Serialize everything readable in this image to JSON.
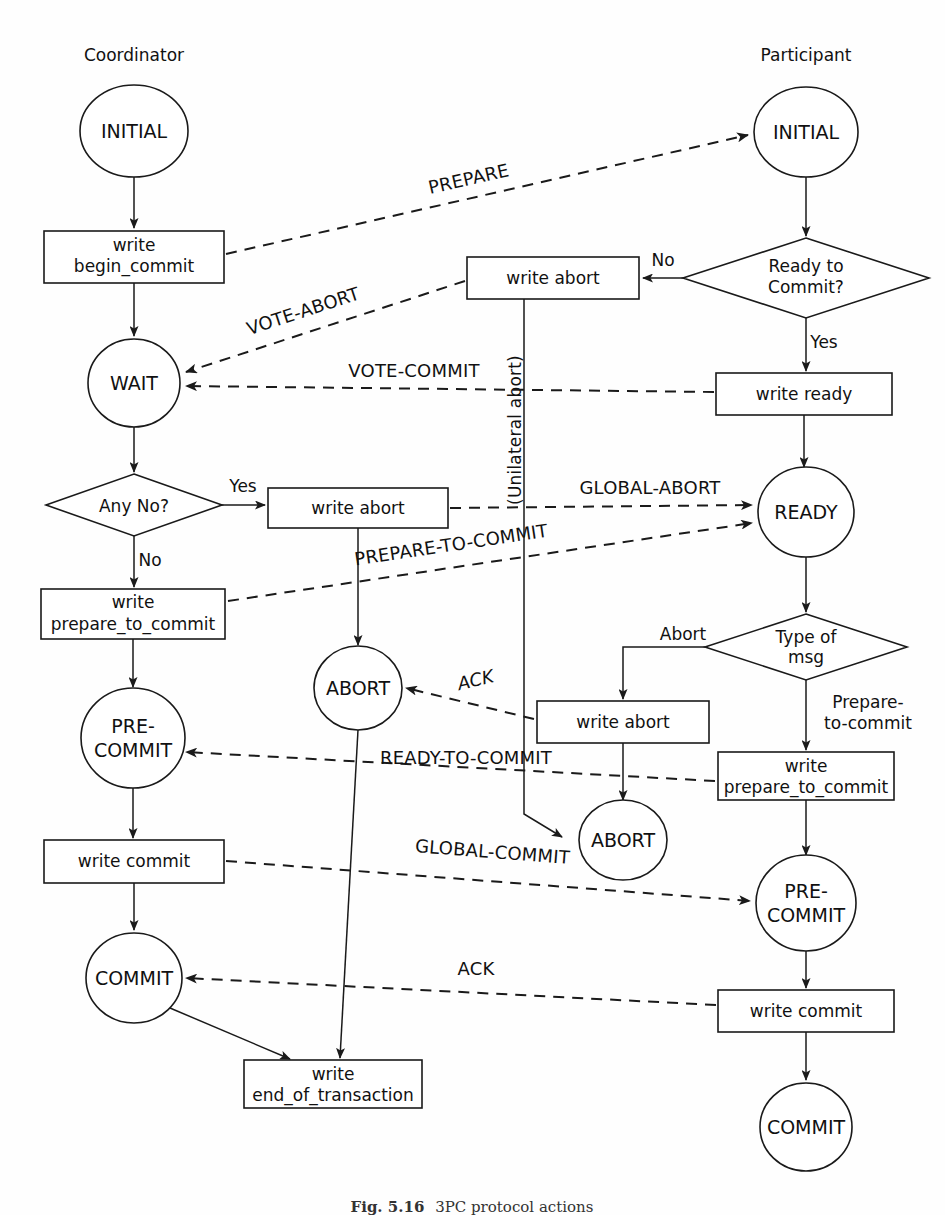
{
  "figure": {
    "caption_label": "Fig. 5.16",
    "caption_text": "3PC protocol actions",
    "lanes": {
      "left": "Coordinator",
      "right": "Participant"
    }
  },
  "coordinator": {
    "states": {
      "initial": "INITIAL",
      "wait": "WAIT",
      "pre_commit": "PRE-\nCOMMIT",
      "pre_commit_line1": "PRE-",
      "pre_commit_line2": "COMMIT",
      "commit": "COMMIT",
      "abort": "ABORT"
    },
    "actions": {
      "begin_commit_line1": "write",
      "begin_commit_line2": "begin_commit",
      "write_abort": "write abort",
      "prepare_to_commit_line1": "write",
      "prepare_to_commit_line2": "prepare_to_commit",
      "write_commit": "write commit",
      "end_of_transaction_line1": "write",
      "end_of_transaction_line2": "end_of_transaction"
    },
    "decisions": {
      "any_no": "Any No?"
    },
    "branch_labels": {
      "any_no_yes": "Yes",
      "any_no_no": "No"
    }
  },
  "participant": {
    "states": {
      "initial": "INITIAL",
      "ready": "READY",
      "pre_commit_line1": "PRE-",
      "pre_commit_line2": "COMMIT",
      "commit": "COMMIT",
      "abort": "ABORT"
    },
    "actions": {
      "write_abort_top": "write abort",
      "write_ready": "write ready",
      "write_abort_mid": "write abort",
      "prepare_to_commit_line1": "write",
      "prepare_to_commit_line2": "prepare_to_commit",
      "write_commit": "write commit"
    },
    "decisions": {
      "ready_to_commit_line1": "Ready to",
      "ready_to_commit_line2": "Commit?",
      "type_of_msg_line1": "Type of",
      "type_of_msg_line2": "msg"
    },
    "branch_labels": {
      "ready_no": "No",
      "ready_yes": "Yes",
      "msg_abort": "Abort",
      "msg_prepare_line1": "Prepare-",
      "msg_prepare_line2": "to-commit"
    },
    "annotations": {
      "unilateral_abort": "(Unilateral abort)"
    }
  },
  "messages": {
    "prepare": "PREPARE",
    "vote_abort": "VOTE-ABORT",
    "vote_commit": "VOTE-COMMIT",
    "global_abort": "GLOBAL-ABORT",
    "prepare_to_commit": "PREPARE-TO-COMMIT",
    "ack_abort": "ACK",
    "ready_to_commit": "READY-TO-COMMIT",
    "global_commit": "GLOBAL-COMMIT",
    "ack_commit": "ACK"
  },
  "colors": {
    "stroke": "#1a1a1a",
    "background": "#ffffff"
  }
}
